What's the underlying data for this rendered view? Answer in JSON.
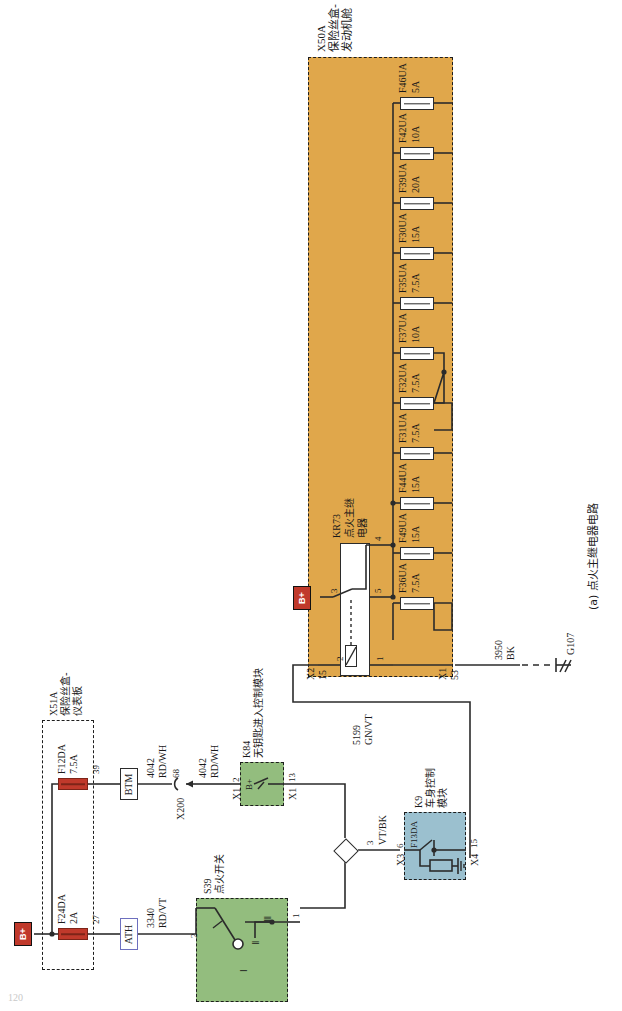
{
  "figure": {
    "caption": "(a) 点火主继电器电路",
    "page_number": "120"
  },
  "engine_fuse_box": {
    "ref": "X50A",
    "name_line1": "保险丝盒-",
    "name_line2": "发动机舱",
    "relay": {
      "ref": "KR73",
      "name_line1": "点火主继",
      "name_line2": "电器",
      "pins": [
        "3",
        "4",
        "5",
        "2",
        "1"
      ]
    },
    "connectors": [
      {
        "label": "X2",
        "pin": "15"
      },
      {
        "label": "X1",
        "pin": "53"
      }
    ],
    "fuses": [
      {
        "ref": "F46UA",
        "rating": "5A"
      },
      {
        "ref": "F42UA",
        "rating": "10A"
      },
      {
        "ref": "F39UA",
        "rating": "20A"
      },
      {
        "ref": "F30UA",
        "rating": "15A"
      },
      {
        "ref": "F35UA",
        "rating": "7.5A"
      },
      {
        "ref": "F37UA",
        "rating": "10A"
      },
      {
        "ref": "F32UA",
        "rating": "7.5A"
      },
      {
        "ref": "F31UA",
        "rating": "7.5A"
      },
      {
        "ref": "F44UA",
        "rating": "15A"
      },
      {
        "ref": "F49UA",
        "rating": "15A"
      },
      {
        "ref": "F36UA",
        "rating": "7.5A"
      }
    ]
  },
  "ip_fuse_box": {
    "ref": "X51A",
    "name_line1": "保险丝盒-",
    "name_line2": "仪表板",
    "fuses": [
      {
        "ref": "F12DA",
        "rating": "7.5A",
        "pin": "39"
      },
      {
        "ref": "F24DA",
        "rating": "2A",
        "pin": "27"
      }
    ]
  },
  "keyless_module": {
    "ref": "K84",
    "name": "无钥匙进入控制模块",
    "pin_in_label": "X1",
    "pin_in": "2",
    "pin_out_label": "X1",
    "pin_out": "13",
    "bplus_label": "B+"
  },
  "body_control_module": {
    "ref": "K9",
    "name_line1": "车身控制",
    "name_line2": "模块",
    "internal_fuse": "F13DA",
    "pin_in_label": "X3",
    "pin_in": "6",
    "pin_out_label": "X4",
    "pin_out": "15"
  },
  "ignition_switch": {
    "ref": "S39",
    "name": "点火开关",
    "positions": [
      "Ⅰ",
      "Ⅱ",
      "Ⅲ"
    ],
    "pin_left": "2",
    "pin_right": "1"
  },
  "battery_markers": [
    {
      "label": "B+"
    },
    {
      "label": "B+"
    }
  ],
  "wires": [
    {
      "number": "4042",
      "colors": "RD/WH",
      "pin": "68"
    },
    {
      "number": "4042",
      "colors": "RD/WH"
    },
    {
      "number": "3340",
      "colors": "RD/VT"
    },
    {
      "number": "5199",
      "colors": "GN/VT"
    },
    {
      "number": "3950",
      "colors": "BK"
    },
    {
      "number": "3",
      "colors": "VT/BK"
    }
  ],
  "inline_connectors": [
    {
      "label": "BTM"
    },
    {
      "label": "ATH"
    },
    {
      "label": "X200"
    }
  ],
  "ground": {
    "ref": "G107",
    "wire_number": "3950",
    "wire_color": "BK"
  },
  "colors": {
    "fusebox_fill": "#e0a74b",
    "module_green": "#93bd7e",
    "module_blue": "#9bc0cf",
    "battery_red": "#c0392b",
    "line": "#2b2b2b"
  }
}
